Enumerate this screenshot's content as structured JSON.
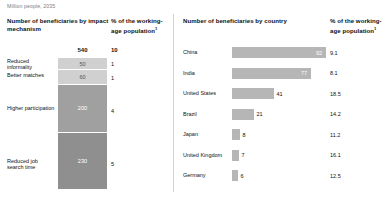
{
  "subtitle": "Million people, 2035",
  "left": {
    "header_main": "Number of beneficiaries by impact mechanism",
    "header_pct": "% of the working-age population",
    "header_pct_sup": "1",
    "total_value": "540",
    "total_pct": "10"
  },
  "right": {
    "header_main": "Number of beneficiaries by country",
    "header_pct": "% of the working-age population",
    "header_pct_sup": "1"
  },
  "chart_data": [
    {
      "type": "bar",
      "orientation": "vertical-stacked",
      "title": "Number of beneficiaries by impact mechanism",
      "subtitle": "Million people, 2035",
      "xlabel": "",
      "ylabel": "Million people",
      "total": 540,
      "total_pct": 10,
      "categories": [
        "Reduced informality",
        "Better matches",
        "Higher participation",
        "Reduced job search time"
      ],
      "values": [
        50,
        60,
        200,
        230
      ],
      "pct_working_age": [
        1,
        1,
        4,
        5
      ],
      "segment_colors": [
        "#d0d0d0",
        "#d0d0d0",
        "#a0a0a0",
        "#8f8f8f"
      ],
      "value_label_colors": [
        "#555555",
        "#555555",
        "#ffffff",
        "#ffffff"
      ]
    },
    {
      "type": "bar",
      "orientation": "horizontal",
      "title": "Number of beneficiaries by country",
      "subtitle": "Million people, 2035",
      "xlabel": "Million people",
      "ylabel": "",
      "categories": [
        "China",
        "India",
        "United States",
        "Brazil",
        "Japan",
        "United Kingdom",
        "Germany"
      ],
      "values": [
        92,
        77,
        41,
        21,
        8,
        7,
        6
      ],
      "pct_working_age": [
        9.1,
        8.1,
        18.5,
        14.2,
        11.2,
        16.1,
        12.5
      ],
      "xlim": [
        0,
        92
      ],
      "bar_color": "#b6b6b6",
      "grid": false,
      "legend": "none"
    }
  ],
  "rows_right": [
    {
      "name": "China",
      "value": "92",
      "pct": "9.1",
      "bar_w": 94,
      "inside": true
    },
    {
      "name": "India",
      "value": "77",
      "pct": "8.1",
      "bar_w": 79,
      "inside": true
    },
    {
      "name": "United States",
      "value": "41",
      "pct": "18.5",
      "bar_w": 42,
      "inside": false
    },
    {
      "name": "Brazil",
      "value": "21",
      "pct": "14.2",
      "bar_w": 22,
      "inside": false
    },
    {
      "name": "Japan",
      "value": "8",
      "pct": "11.2",
      "bar_w": 8,
      "inside": false
    },
    {
      "name": "United Kingdom",
      "value": "7",
      "pct": "16.1",
      "bar_w": 7,
      "inside": false
    },
    {
      "name": "Germany",
      "value": "6",
      "pct": "12.5",
      "bar_w": 6,
      "inside": false
    }
  ],
  "rows_left": [
    {
      "name": "Reduced informality",
      "value": "50",
      "pct": "1",
      "h": 12,
      "color": "#d0d0d0",
      "dark": true
    },
    {
      "name": "Better matches",
      "value": "60",
      "pct": "1",
      "h": 14.5,
      "color": "#d0d0d0",
      "dark": true
    },
    {
      "name": "Higher participation",
      "value": "200",
      "pct": "4",
      "h": 48.5,
      "color": "#a0a0a0",
      "dark": false
    },
    {
      "name": "Reduced job search time",
      "value": "230",
      "pct": "5",
      "h": 56,
      "color": "#8f8f8f",
      "dark": false
    }
  ]
}
